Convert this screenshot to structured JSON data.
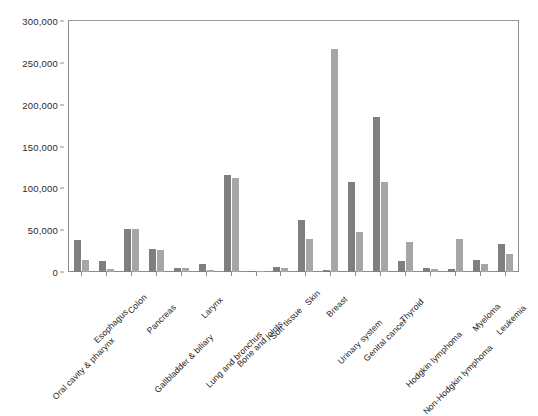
{
  "chart_data": {
    "type": "bar",
    "title": "",
    "xlabel": "",
    "ylabel": "",
    "ylim": [
      0,
      300000
    ],
    "ytick_labels": [
      "0",
      "50,000",
      "100,000",
      "150,000",
      "200,000",
      "250,000",
      "300,000"
    ],
    "ytick_values": [
      0,
      50000,
      100000,
      150000,
      200000,
      250000,
      300000
    ],
    "grid": false,
    "legend": "none",
    "colors": {
      "series1": "#7f7f7f",
      "series2": "#a6a6a6"
    },
    "categories": [
      "Oral cavity & pharynx",
      "Esophagus",
      "Colon",
      "Pancreas",
      "Gallbladder & biliary",
      "Larynx",
      "Lung and bronchus",
      "Bone and joints",
      "Soft tissue",
      "Skin",
      "Breast",
      "Urinary system",
      "Genital cancer",
      "Thyroid",
      "Hodgkin lymphoma",
      "Non-Hodgkin lymphoma",
      "Myeloma",
      "Leukemia"
    ],
    "series": [
      {
        "name": "Series 1",
        "color": "#7f7f7f",
        "values": [
          38000,
          13000,
          52000,
          28000,
          4500,
          9500,
          116000,
          1600,
          6500,
          62000,
          2000,
          108000,
          185000,
          13000,
          4500,
          3500,
          14000,
          34000
        ]
      },
      {
        "name": "Series 2",
        "color": "#a6a6a6",
        "values": [
          14000,
          3500,
          51000,
          26000,
          5000,
          2000,
          112000,
          1200,
          5000,
          40000,
          267000,
          48000,
          108000,
          36000,
          3500,
          40000,
          10000,
          21000
        ]
      }
    ]
  }
}
